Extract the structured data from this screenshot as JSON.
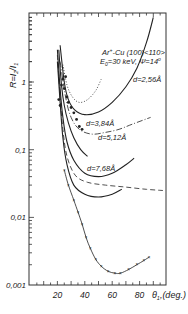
{
  "chart_data": {
    "type": "line",
    "title": "",
    "annotation": {
      "line1": "Ar+ → Cu(100)<110>",
      "line1_parts": {
        "a": "Ar",
        "b": "+",
        "c": "-Cu (100)<110>"
      },
      "line2_parts": {
        "a": "E",
        "b": "0",
        "c": "=30 keV, Ψ=14",
        "d": "o"
      }
    },
    "xlabel": "θ₁ (deg.)",
    "xlabel_parts": {
      "a": "θ",
      "b": "1",
      "c": ",(deg.)"
    },
    "ylabel": "R=I₂/I₁",
    "ylabel_parts": {
      "a": "R=I",
      "b": "2",
      "c": "/I",
      "d": "1"
    },
    "xlim": [
      0,
      100
    ],
    "ylim": [
      0.001,
      10
    ],
    "yscale": "log",
    "x_ticks": [
      20,
      40,
      60,
      80
    ],
    "x_tick_labels": [
      "20",
      "40",
      "60",
      "80"
    ],
    "y_ticks": [
      0.001,
      0.01,
      0.1,
      1
    ],
    "y_tick_labels": [
      "0,001",
      "0,01",
      "0,1",
      "1"
    ],
    "grid": false,
    "series": [
      {
        "name": "d=2.56Å",
        "label": "d=2,56Å",
        "style": "solid",
        "points": [
          [
            22,
            3.5
          ],
          [
            25,
            1.0
          ],
          [
            28,
            0.55
          ],
          [
            33,
            0.38
          ],
          [
            40,
            0.33
          ],
          [
            50,
            0.36
          ],
          [
            60,
            0.5
          ],
          [
            70,
            0.85
          ],
          [
            78,
            1.6
          ],
          [
            85,
            3.8
          ],
          [
            90,
            9.0
          ]
        ]
      },
      {
        "name": "dash-dot (2.56Å set)",
        "label": "",
        "style": "dashdot",
        "points": [
          [
            22,
            2.0
          ],
          [
            26,
            0.6
          ],
          [
            30,
            0.3
          ],
          [
            36,
            0.2
          ],
          [
            45,
            0.17
          ],
          [
            55,
            0.18
          ],
          [
            65,
            0.2
          ],
          [
            75,
            0.24
          ],
          [
            88,
            0.3
          ]
        ]
      },
      {
        "name": "dotted",
        "label": "",
        "style": "dotted",
        "points": [
          [
            24,
            1.8
          ],
          [
            27,
            0.9
          ],
          [
            31,
            0.6
          ],
          [
            36,
            0.5
          ],
          [
            42,
            0.55
          ],
          [
            48,
            0.75
          ],
          [
            52,
            1.1
          ]
        ]
      },
      {
        "name": "d=3.84Å",
        "label": "d=3,84Å",
        "style": "solid",
        "points": [
          [
            21,
            3.0
          ],
          [
            23,
            0.9
          ],
          [
            25,
            0.45
          ],
          [
            28,
            0.25
          ],
          [
            32,
            0.15
          ],
          [
            37,
            0.1
          ],
          [
            42,
            0.08
          ]
        ]
      },
      {
        "name": "d=5.12Å",
        "label": "d=5,12Å",
        "style": "solid",
        "points": [
          [
            20,
            3.0
          ],
          [
            22,
            0.8
          ],
          [
            24,
            0.3
          ],
          [
            27,
            0.13
          ],
          [
            32,
            0.07
          ],
          [
            40,
            0.045
          ],
          [
            50,
            0.04
          ],
          [
            60,
            0.045
          ],
          [
            70,
            0.06
          ],
          [
            76,
            0.075
          ]
        ]
      },
      {
        "name": "dashed",
        "label": "",
        "style": "dashed",
        "points": [
          [
            20,
            2.5
          ],
          [
            22,
            0.6
          ],
          [
            24,
            0.2
          ],
          [
            27,
            0.08
          ],
          [
            33,
            0.042
          ],
          [
            42,
            0.033
          ],
          [
            55,
            0.03
          ],
          [
            70,
            0.028
          ],
          [
            85,
            0.026
          ],
          [
            97,
            0.025
          ]
        ]
      },
      {
        "name": "d=7.68Å",
        "label": "d=7,68Å",
        "style": "solid",
        "points": [
          [
            20,
            2.0
          ],
          [
            22,
            0.5
          ],
          [
            24,
            0.15
          ],
          [
            27,
            0.06
          ],
          [
            32,
            0.03
          ],
          [
            40,
            0.022
          ],
          [
            50,
            0.02
          ],
          [
            60,
            0.022
          ],
          [
            67,
            0.026
          ]
        ]
      },
      {
        "name": "experimental (lower)",
        "label": "",
        "style": "solid-markers",
        "points": [
          [
            25,
            0.05
          ],
          [
            28,
            0.03
          ],
          [
            32,
            0.018
          ],
          [
            35,
            0.012
          ],
          [
            38,
            0.008
          ],
          [
            41,
            0.005
          ],
          [
            44,
            0.0035
          ],
          [
            48,
            0.0024
          ],
          [
            52,
            0.0019
          ],
          [
            57,
            0.0016
          ],
          [
            62,
            0.0015
          ],
          [
            66,
            0.0015
          ],
          [
            72,
            0.0017
          ],
          [
            78,
            0.002
          ],
          [
            83,
            0.0023
          ],
          [
            87,
            0.0026
          ]
        ]
      },
      {
        "name": "experimental scatter (upper)",
        "label": "",
        "style": "markers",
        "points": [
          [
            21,
            0.55
          ],
          [
            22,
            0.45
          ],
          [
            23,
            0.9
          ],
          [
            24,
            1.1
          ],
          [
            25,
            0.8
          ],
          [
            26,
            1.2
          ],
          [
            27,
            0.6
          ],
          [
            28,
            0.5
          ],
          [
            30,
            0.42
          ],
          [
            32,
            0.35
          ],
          [
            34,
            0.28
          ],
          [
            36,
            0.22
          ],
          [
            38,
            0.2
          ]
        ]
      }
    ]
  }
}
